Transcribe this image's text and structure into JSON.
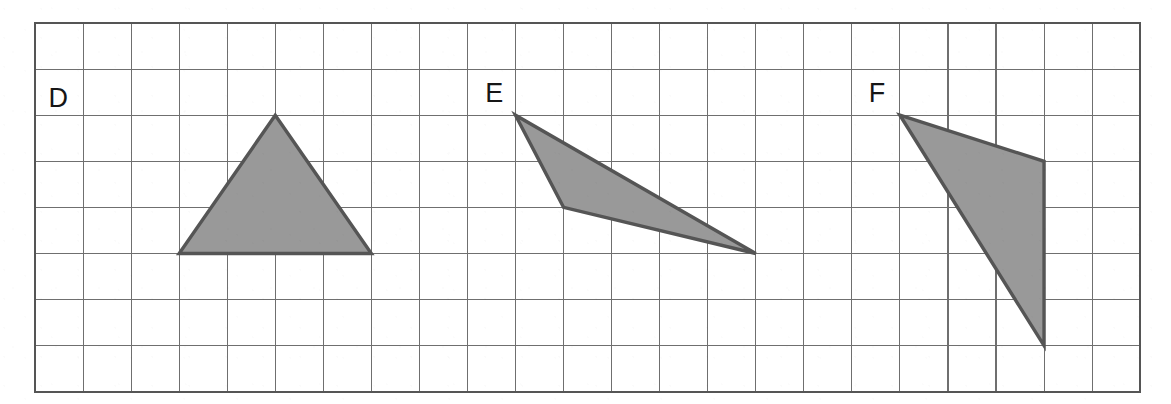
{
  "figure": {
    "background_color": "#ffffff",
    "grid": {
      "origin_px": {
        "x": 35,
        "y": 23
      },
      "cell_width_px": 48.05,
      "cell_height_px": 46.1,
      "columns": 23,
      "rows": 8,
      "line_color": "#6f6f6f",
      "frame_color": "#555555",
      "grid_visible": true
    },
    "shape_style": {
      "fill_color": "#999999",
      "stroke_color": "#555555",
      "stroke_width_px": 3.4
    },
    "labels": [
      {
        "text": "D",
        "grid_x": 0.28,
        "grid_y": 1.82
      },
      {
        "text": "E",
        "grid_x": 9.37,
        "grid_y": 1.72
      },
      {
        "text": "F",
        "grid_x": 17.35,
        "grid_y": 1.72
      }
    ],
    "shapes": [
      {
        "name": "triangle-d",
        "label": "D",
        "type": "triangle",
        "vertices_grid": [
          [
            5,
            2
          ],
          [
            3,
            5
          ],
          [
            7,
            5
          ]
        ],
        "base_units": 4,
        "height_units": 3
      },
      {
        "name": "triangle-e",
        "label": "E",
        "type": "triangle",
        "vertices_grid": [
          [
            10,
            2
          ],
          [
            11,
            4
          ],
          [
            15,
            5
          ]
        ],
        "base_units": 0,
        "height_units": 0
      },
      {
        "name": "triangle-f",
        "label": "F",
        "type": "triangle",
        "vertices_grid": [
          [
            18,
            2
          ],
          [
            21,
            3
          ],
          [
            21,
            7
          ]
        ],
        "base_units": 4,
        "height_units": 3
      }
    ]
  }
}
